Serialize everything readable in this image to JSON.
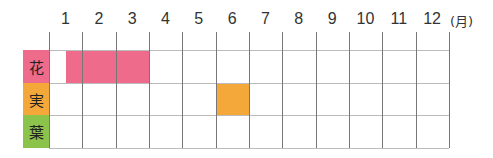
{
  "chart_data": {
    "type": "heatmap",
    "title": "",
    "xlabel": "(月)",
    "ylabel": "",
    "categories": [
      "1",
      "2",
      "3",
      "4",
      "5",
      "6",
      "7",
      "8",
      "9",
      "10",
      "11",
      "12"
    ],
    "unit": "(月)",
    "rows": [
      {
        "label": "花",
        "color": "#ee6b8b",
        "periods": [
          {
            "start": 1.5,
            "end": 4.0
          }
        ],
        "note": "mid-January through end of March"
      },
      {
        "label": "実",
        "color": "#f5a83a",
        "periods": [
          {
            "start": 6.0,
            "end": 7.0
          }
        ],
        "note": "June"
      },
      {
        "label": "葉",
        "color": "#8cc34a",
        "periods": []
      }
    ],
    "grid": true,
    "legend": "none"
  },
  "colors": {
    "flower": "#ee6b8b",
    "fruit": "#f5a83a",
    "leaf": "#8cc34a",
    "grid": "#777777"
  }
}
